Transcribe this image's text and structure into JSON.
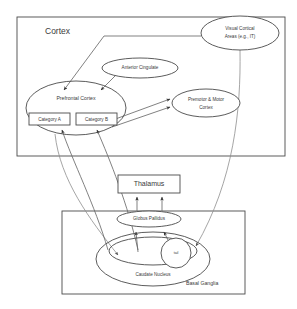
{
  "diagram": {
    "colors": {
      "stroke": "#4a4a4a",
      "edge": "#6a6a6a",
      "edge_faint": "#8e8e8e",
      "text": "#3a3a3a",
      "background": "#ffffff"
    },
    "frames": [
      {
        "id": "cortex",
        "label": "Cortex",
        "label_position": "top-left",
        "x": 17,
        "y": 17,
        "width": 268,
        "height": 139
      },
      {
        "id": "basal-ganglia",
        "label": "Basal Ganglia",
        "label_position": "bottom-right",
        "x": 62,
        "y": 211,
        "width": 183,
        "height": 83
      }
    ],
    "nodes": [
      {
        "id": "visual-cortical-areas",
        "shape": "ellipse",
        "label_line1": "Visual Cortical",
        "label_line2": "Areas (e.g., IT)",
        "cx": 240,
        "cy": 33,
        "rx": 39,
        "ry": 17
      },
      {
        "id": "anterior-cingulate",
        "shape": "ellipse",
        "label_line1": "Anterior Cingulate",
        "label_line2": "",
        "cx": 140,
        "cy": 68,
        "rx": 38,
        "ry": 10
      },
      {
        "id": "prefrontal-cortex",
        "shape": "ellipse",
        "label_line1": "Prefrontal Cortex",
        "label_line2": "",
        "cx": 76,
        "cy": 108,
        "rx": 50,
        "ry": 27
      },
      {
        "id": "premotor-motor-cortex",
        "shape": "ellipse",
        "label_line1": "Premotor & Motor",
        "label_line2": "Cortex",
        "cx": 206,
        "cy": 103,
        "rx": 34,
        "ry": 14
      },
      {
        "id": "category-a",
        "shape": "rect",
        "label_line1": "Category A",
        "label_line2": "",
        "x": 29,
        "y": 113,
        "width": 41,
        "height": 12
      },
      {
        "id": "category-b",
        "shape": "rect",
        "label_line1": "Category B",
        "label_line2": "",
        "x": 76,
        "y": 113,
        "width": 41,
        "height": 12
      },
      {
        "id": "thalamus",
        "shape": "rect",
        "label_line1": "Thalamus",
        "label_line2": "",
        "x": 118,
        "y": 175,
        "width": 62,
        "height": 18
      },
      {
        "id": "globus-pallidus",
        "shape": "ellipse",
        "label_line1": "Globus Pallidus",
        "label_line2": "",
        "cx": 149,
        "cy": 219,
        "rx": 32,
        "ry": 8
      },
      {
        "id": "caudate-nucleus",
        "shape": "ellipse",
        "label_line1": "Caudate Nucleus",
        "label_line2": "",
        "cx": 153,
        "cy": 259,
        "rx": 57,
        "ry": 27
      },
      {
        "id": "caudate-inner-band",
        "shape": "ellipse",
        "label_line1": "",
        "label_line2": "",
        "cx": 153,
        "cy": 251,
        "rx": 44,
        "ry": 14
      },
      {
        "id": "caudate-tail",
        "shape": "circle",
        "label_line1": "tail",
        "label_line2": "",
        "cx": 176,
        "cy": 253,
        "rx": 15,
        "ry": 15
      }
    ],
    "edges": [
      {
        "id": "visual-to-prefrontal",
        "from": "visual-cortical-areas",
        "to": "prefrontal-cortex",
        "arrow": true
      },
      {
        "id": "anterior-cingulate-to-prefrontal",
        "from": "anterior-cingulate",
        "to": "prefrontal-cortex",
        "arrow": true
      },
      {
        "id": "prefrontal-to-premotor-upper",
        "from": "prefrontal-cortex",
        "to": "premotor-motor-cortex",
        "arrow": true
      },
      {
        "id": "prefrontal-to-premotor-lower",
        "from": "category-b",
        "to": "premotor-motor-cortex",
        "arrow": true
      },
      {
        "id": "visual-to-caudate-tail",
        "from": "visual-cortical-areas",
        "to": "caudate-tail",
        "arrow": true
      },
      {
        "id": "prefrontal-to-caudate",
        "from": "prefrontal-cortex",
        "to": "caudate-nucleus",
        "arrow": true
      },
      {
        "id": "caudate-to-category-a",
        "from": "caudate-nucleus",
        "to": "category-a",
        "arrow": true
      },
      {
        "id": "caudate-to-category-b",
        "from": "caudate-nucleus",
        "to": "category-b",
        "arrow": true
      },
      {
        "id": "caudate-to-globus-left",
        "from": "caudate-nucleus",
        "to": "globus-pallidus",
        "arrow": true
      },
      {
        "id": "caudate-tail-to-globus",
        "from": "caudate-tail",
        "to": "globus-pallidus",
        "arrow": true
      },
      {
        "id": "globus-to-thalamus-left",
        "from": "globus-pallidus",
        "to": "thalamus",
        "arrow": true
      },
      {
        "id": "globus-to-thalamus-right",
        "from": "globus-pallidus",
        "to": "thalamus",
        "arrow": true
      }
    ]
  }
}
